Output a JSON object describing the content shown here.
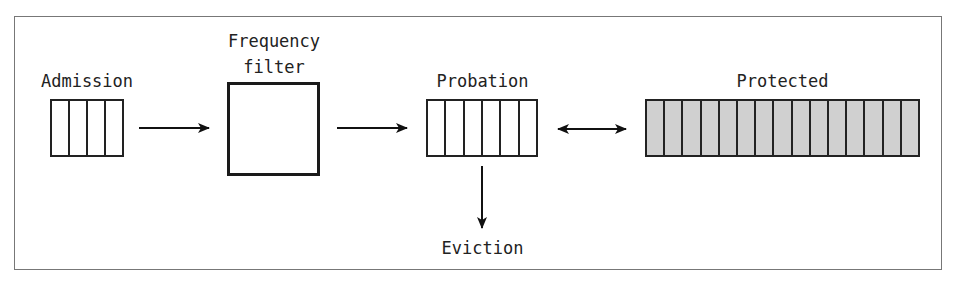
{
  "diagram": {
    "nodes": {
      "admission": {
        "label": "Admission",
        "cells": 4,
        "fill": "#ffffff"
      },
      "frequency_filter": {
        "label_line1": "Frequency",
        "label_line2": "filter"
      },
      "probation": {
        "label": "Probation",
        "cells": 6,
        "fill": "#ffffff"
      },
      "protected": {
        "label": "Protected",
        "cells": 15,
        "fill": "#d0d0d0"
      },
      "eviction": {
        "label": "Eviction"
      }
    },
    "edges": [
      {
        "from": "admission",
        "to": "frequency_filter",
        "type": "arrow"
      },
      {
        "from": "frequency_filter",
        "to": "probation",
        "type": "arrow"
      },
      {
        "from": "probation",
        "to": "protected",
        "type": "bidirectional"
      },
      {
        "from": "probation",
        "to": "eviction",
        "type": "arrow"
      }
    ]
  }
}
